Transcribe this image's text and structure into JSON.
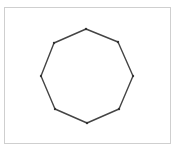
{
  "diagram": {
    "shape": "octagon",
    "frame": {
      "x": 4,
      "y": 7,
      "width": 167,
      "height": 137,
      "border_color": "#cfcfcf"
    },
    "stroke_color": "#444444",
    "vertex_color": "#333333",
    "stroke_width": 1.4,
    "vertex_radius": 1.2,
    "vertices": [
      {
        "name": "top",
        "x": 86,
        "y": 29
      },
      {
        "name": "top-right",
        "x": 118,
        "y": 42
      },
      {
        "name": "right",
        "x": 133,
        "y": 76
      },
      {
        "name": "bottom-right",
        "x": 119,
        "y": 109
      },
      {
        "name": "bottom",
        "x": 87,
        "y": 123
      },
      {
        "name": "bottom-left",
        "x": 55,
        "y": 109
      },
      {
        "name": "left",
        "x": 41,
        "y": 76
      },
      {
        "name": "top-left",
        "x": 54,
        "y": 43
      }
    ]
  }
}
